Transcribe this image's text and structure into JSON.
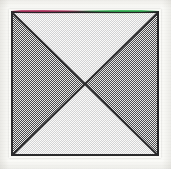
{
  "figure": {
    "caption": "",
    "description": "Square divided by both diagonals into four triangles",
    "background_color": "#fbfbf8",
    "outline_color": "#2b2b2d",
    "square": {
      "x": 11,
      "y": 11,
      "width": 148,
      "height": 145,
      "border_width_px": 2
    },
    "diagonals": {
      "count": 2,
      "color": "#2b2b2d",
      "stroke_width_px": 2,
      "names": [
        "top-left-to-bottom-right",
        "top-right-to-bottom-left"
      ]
    },
    "regions": [
      {
        "name": "top-triangle",
        "position": "top",
        "fill_label": "light halftone",
        "fill_color": "#fbfbfa",
        "tone_percent": 12
      },
      {
        "name": "right-triangle",
        "position": "right",
        "fill_label": "50% checkerboard halftone",
        "fill_color": "#8f8f90",
        "tone_percent": 50
      },
      {
        "name": "bottom-triangle",
        "position": "bottom",
        "fill_label": "light halftone",
        "fill_color": "#fbfbfa",
        "tone_percent": 12
      },
      {
        "name": "left-triangle",
        "position": "left",
        "fill_label": "50% checkerboard halftone",
        "fill_color": "#8f8f90",
        "tone_percent": 50
      }
    ],
    "scan_artifacts": {
      "chromatic_aberration": true,
      "top_edge_left_fringe_color": "#b02e5c",
      "top_edge_right_fringe_color": "#2cb04e",
      "halftone_screen": true
    },
    "center_point": {
      "x": 85,
      "y": 83,
      "label": "diagonal intersection"
    }
  }
}
